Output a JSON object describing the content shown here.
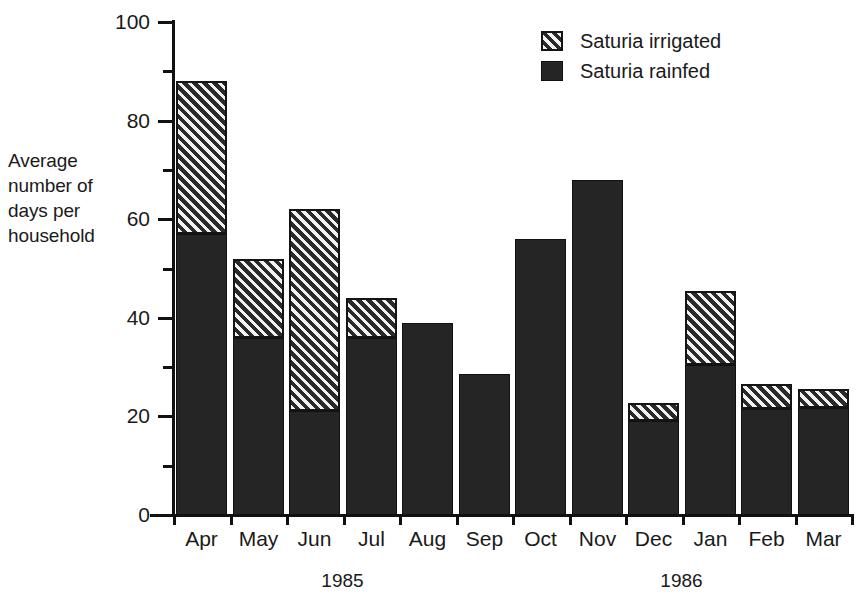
{
  "chart_data": {
    "type": "bar",
    "subtype": "stacked",
    "title": "",
    "xlabel": "",
    "ylabel": "Average number of days per household",
    "ylim": [
      0,
      100
    ],
    "ytick_step": 20,
    "yminor_step": 10,
    "grid": false,
    "legend_position": "top-right",
    "categories": [
      "Apr",
      "May",
      "Jun",
      "Jul",
      "Aug",
      "Sep",
      "Oct",
      "Nov",
      "Dec",
      "Jan",
      "Feb",
      "Mar"
    ],
    "ytick_labels": [
      "0",
      "20",
      "40",
      "60",
      "80",
      "100"
    ],
    "series": [
      {
        "name": "Saturia rainfed",
        "fill": "solid",
        "color": "#252525",
        "values": [
          57,
          36,
          21,
          36,
          39,
          28.7,
          56,
          68,
          19,
          30.5,
          21.5,
          21.7
        ]
      },
      {
        "name": "Saturia irrigated",
        "fill": "hatched",
        "color": "#2a2a2a",
        "values": [
          31,
          16,
          41,
          8,
          0,
          0,
          0,
          0,
          3.7,
          15,
          5,
          3.8
        ]
      }
    ],
    "totals": [
      88,
      52,
      62,
      44,
      39,
      28.7,
      56,
      68,
      22.7,
      45.5,
      26.5,
      25.5
    ],
    "group_labels": [
      {
        "text": "1985",
        "categories": [
          "Apr",
          "May",
          "Jun",
          "Jul",
          "Aug",
          "Sep"
        ]
      },
      {
        "text": "1986",
        "categories": [
          "Oct",
          "Nov",
          "Dec",
          "Jan",
          "Feb",
          "Mar"
        ]
      }
    ]
  },
  "legend": {
    "items": [
      {
        "label": "Saturia irrigated",
        "swatch": "hatched"
      },
      {
        "label": "Saturia rainfed",
        "swatch": "solid"
      }
    ]
  },
  "axes": {
    "y_title_lines": "Average\nnumber of\ndays per\nhousehold"
  }
}
